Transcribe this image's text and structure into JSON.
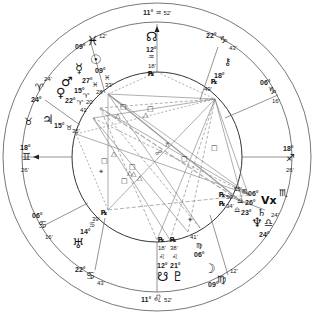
{
  "chart": {
    "type": "natal-wheel",
    "center": [
      157,
      157
    ],
    "radii": {
      "outer": 154,
      "zodiac_inner": 135,
      "inner": 85
    }
  },
  "cusps": {
    "asc": {
      "deg": "18°",
      "sign": "♊",
      "min": "26'"
    },
    "desc": {
      "deg": "18°",
      "sign": "♐",
      "min": "26'"
    },
    "mc": {
      "deg": "11°",
      "sign": "♒",
      "min": "52'"
    },
    "ic": {
      "deg": "11°",
      "sign": "♌",
      "min": "52'"
    },
    "h11": {
      "deg": "22°",
      "sign": "♑",
      "min": "43'"
    },
    "h12": {
      "deg": "06°",
      "sign": "♑",
      "min": "16'"
    },
    "h9": {
      "deg": "09°",
      "sign": "♓",
      "min": "12'"
    },
    "h8": {
      "deg": "24°",
      "sign": "♈",
      "min": "24'"
    },
    "h2": {
      "deg": "06°",
      "sign": "♋",
      "min": "16'"
    },
    "h3": {
      "deg": "22°",
      "sign": "♋",
      "min": "43'"
    },
    "h5": {
      "deg": "09°",
      "sign": "♍",
      "min": "12'"
    },
    "h6": {
      "deg": "24°",
      "sign": "♎",
      "min": "24'"
    }
  },
  "zodiac_extra": {
    "taurus": "♉",
    "scorpio": "♏"
  },
  "planets": {
    "node": {
      "glyph": "☊",
      "deg": "12°",
      "sign": "♒",
      "min": "18'",
      "retro": "℞"
    },
    "sun": {
      "glyph": "☉",
      "deg": "09°",
      "sign": "♓",
      "min": "33'"
    },
    "mercury": {
      "glyph": "☿",
      "deg": "27°",
      "sign": "♓",
      "min": "28'"
    },
    "mars": {
      "glyph": "♂",
      "deg": "15°",
      "sign": "♈",
      "min": "20'"
    },
    "venus": {
      "glyph": "♀",
      "deg": "22°",
      "sign": "♈",
      "min": "41'"
    },
    "jupiter": {
      "glyph": "♃",
      "deg": "15°",
      "sign": "♉",
      "min": "35'"
    },
    "uranus": {
      "glyph": "♅",
      "deg": "14°",
      "sign": "♋",
      "min": "39'",
      "retro": "℞"
    },
    "south_node": {
      "glyph": "☋",
      "deg": "12°",
      "sign": "♌",
      "min": "18'",
      "retro": "℞"
    },
    "pluto": {
      "glyph": "♇",
      "deg": "21°",
      "sign": "♌",
      "min": "38'",
      "retro": "℞"
    },
    "moon": {
      "glyph": "☽",
      "deg": "06°",
      "sign": "♍",
      "min": "41'"
    },
    "neptune": {
      "glyph": "♆",
      "deg": "23°",
      "sign": "♎",
      "min": "34'",
      "retro": "℞"
    },
    "saturn": {
      "glyph": "♄",
      "deg": "26°",
      "sign": "♎",
      "min": "50'",
      "retro": "℞"
    },
    "vertex": {
      "glyph": "Vx",
      "deg": "06°",
      "sign": "♏",
      "min": "55'"
    },
    "chiron": {
      "glyph": "⚷",
      "deg": "18°",
      "sign": "♑",
      "min": "49'",
      "retro": "℞"
    }
  },
  "aspect_glyphs": {
    "square": "□",
    "trine": "△",
    "sextile": "⚹",
    "semisextile": "⚺",
    "quincunx": "⚻",
    "opposition": "☍"
  }
}
